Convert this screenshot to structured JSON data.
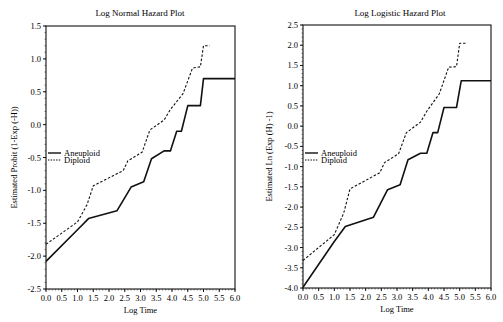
{
  "chart_data": [
    {
      "type": "line",
      "title": "Log Normal Hazard Plot",
      "xlabel": "Log Time",
      "ylabel": "Estimated Probit (1-Exp (-H))",
      "xlim": [
        0.0,
        6.0
      ],
      "ylim": [
        -2.5,
        1.5
      ],
      "x_ticks": [
        "0.0",
        "0.5",
        "1.0",
        "1.5",
        "2.0",
        "2.5",
        "3.0",
        "3.5",
        "4.0",
        "4.5",
        "5.0",
        "5.5",
        "6.0"
      ],
      "y_ticks": [
        "-2.5",
        "-2.0",
        "-1.5",
        "-1.0",
        "-0.5",
        "0.0",
        "0.5",
        "1.0",
        "1.5"
      ],
      "grid": false,
      "legend_position": "left-middle inside",
      "series": [
        {
          "name": "Aneuploid",
          "style": "solid",
          "points": [
            [
              0.0,
              -2.08
            ],
            [
              1.0,
              -1.6
            ],
            [
              1.35,
              -1.43
            ],
            [
              2.25,
              -1.31
            ],
            [
              2.7,
              -0.95
            ],
            [
              3.1,
              -0.87
            ],
            [
              3.35,
              -0.52
            ],
            [
              3.75,
              -0.4
            ],
            [
              3.95,
              -0.4
            ],
            [
              4.15,
              -0.1
            ],
            [
              4.3,
              -0.1
            ],
            [
              4.5,
              0.29
            ],
            [
              4.9,
              0.29
            ],
            [
              5.0,
              0.7
            ],
            [
              6.0,
              0.7
            ]
          ]
        },
        {
          "name": "Diploid",
          "style": "dashed",
          "points": [
            [
              0.0,
              -1.82
            ],
            [
              1.0,
              -1.48
            ],
            [
              1.3,
              -1.22
            ],
            [
              1.5,
              -0.93
            ],
            [
              2.45,
              -0.7
            ],
            [
              2.6,
              -0.55
            ],
            [
              3.05,
              -0.42
            ],
            [
              3.3,
              -0.08
            ],
            [
              3.75,
              0.07
            ],
            [
              3.95,
              0.23
            ],
            [
              4.35,
              0.47
            ],
            [
              4.65,
              0.86
            ],
            [
              4.9,
              0.88
            ],
            [
              5.0,
              1.2
            ],
            [
              5.2,
              1.2
            ]
          ]
        }
      ]
    },
    {
      "type": "line",
      "title": "Log Logistic Hazard Plot",
      "xlabel": "Log Time",
      "ylabel": "Estimated Ln (Exp (H) -1)",
      "xlim": [
        0.0,
        6.0
      ],
      "ylim": [
        -4.0,
        2.5
      ],
      "x_ticks": [
        "0.0",
        "0.5",
        "1.0",
        "1.5",
        "2.0",
        "2.5",
        "3.0",
        "3.5",
        "4.0",
        "4.5",
        "5.0",
        "5.5",
        "6.0"
      ],
      "y_ticks": [
        "-4.0",
        "-3.5",
        "-3.0",
        "-2.5",
        "-2.0",
        "-1.5",
        "-1.0",
        "-0.5",
        "0.0",
        "0.5",
        "1.0",
        "1.5",
        "2.0",
        "2.5"
      ],
      "grid": false,
      "legend_position": "left-middle inside",
      "series": [
        {
          "name": "Aneuploid",
          "style": "solid",
          "points": [
            [
              0.0,
              -3.98
            ],
            [
              1.0,
              -2.85
            ],
            [
              1.35,
              -2.48
            ],
            [
              2.25,
              -2.25
            ],
            [
              2.7,
              -1.57
            ],
            [
              3.1,
              -1.45
            ],
            [
              3.35,
              -0.83
            ],
            [
              3.75,
              -0.67
            ],
            [
              3.95,
              -0.67
            ],
            [
              4.15,
              -0.16
            ],
            [
              4.3,
              -0.16
            ],
            [
              4.5,
              0.46
            ],
            [
              4.9,
              0.46
            ],
            [
              5.05,
              1.12
            ],
            [
              6.0,
              1.12
            ]
          ]
        },
        {
          "name": "Diploid",
          "style": "dashed",
          "points": [
            [
              0.0,
              -3.32
            ],
            [
              1.0,
              -2.68
            ],
            [
              1.3,
              -2.15
            ],
            [
              1.5,
              -1.55
            ],
            [
              2.45,
              -1.15
            ],
            [
              2.6,
              -0.9
            ],
            [
              3.05,
              -0.68
            ],
            [
              3.3,
              -0.16
            ],
            [
              3.75,
              0.1
            ],
            [
              3.95,
              0.37
            ],
            [
              4.35,
              0.8
            ],
            [
              4.65,
              1.46
            ],
            [
              4.9,
              1.47
            ],
            [
              5.0,
              2.05
            ],
            [
              5.2,
              2.05
            ]
          ]
        }
      ]
    }
  ]
}
